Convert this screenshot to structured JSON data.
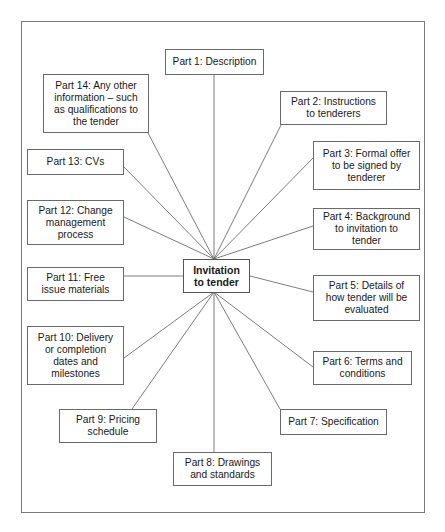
{
  "diagram": {
    "type": "hub-and-spoke",
    "center": {
      "id": "center",
      "label": "Invitation to tender",
      "lines": [
        "Invitation",
        "to tender"
      ]
    },
    "parts": [
      {
        "id": "part1",
        "label": "Part 1: Description",
        "lines": [
          "Part 1: Description"
        ]
      },
      {
        "id": "part2",
        "label": "Part 2: Instructions to tenderers",
        "lines": [
          "Part 2: Instructions",
          "to tenderers"
        ]
      },
      {
        "id": "part3",
        "label": "Part 3: Formal offer to be signed by tenderer",
        "lines": [
          "Part 3: Formal offer",
          "to be signed by",
          "tenderer"
        ]
      },
      {
        "id": "part4",
        "label": "Part 4: Background to invitation to tender",
        "lines": [
          "Part 4: Background",
          "to invitation to",
          "tender"
        ]
      },
      {
        "id": "part5",
        "label": "Part 5: Details of how tender will be evaluated",
        "lines": [
          "Part 5: Details of",
          "how tender will be",
          "evaluated"
        ]
      },
      {
        "id": "part6",
        "label": "Part 6: Terms and conditions",
        "lines": [
          "Part 6: Terms and",
          "conditions"
        ]
      },
      {
        "id": "part7",
        "label": "Part 7: Specification",
        "lines": [
          "Part 7: Specification"
        ]
      },
      {
        "id": "part8",
        "label": "Part 8: Drawings and standards",
        "lines": [
          "Part 8: Drawings",
          "and standards"
        ]
      },
      {
        "id": "part9",
        "label": "Part 9: Pricing schedule",
        "lines": [
          "Part 9: Pricing",
          "schedule"
        ]
      },
      {
        "id": "part10",
        "label": "Part 10: Delivery or completion dates and milestones",
        "lines": [
          "Part 10: Delivery",
          "or completion",
          "dates and",
          "milestones"
        ]
      },
      {
        "id": "part11",
        "label": "Part 11: Free issue materials",
        "lines": [
          "Part 11: Free",
          "issue materials"
        ]
      },
      {
        "id": "part12",
        "label": "Part 12: Change management process",
        "lines": [
          "Part 12: Change",
          "management",
          "process"
        ]
      },
      {
        "id": "part13",
        "label": "Part 13: CVs",
        "lines": [
          "Part 13: CVs"
        ]
      },
      {
        "id": "part14",
        "label": "Part 14: Any other information – such as qualifications to the tender",
        "lines": [
          "Part 14: Any other",
          "information – such",
          "as qualifications to",
          "the tender"
        ]
      }
    ],
    "edges": [
      [
        "center",
        "part1"
      ],
      [
        "center",
        "part2"
      ],
      [
        "center",
        "part3"
      ],
      [
        "center",
        "part4"
      ],
      [
        "center",
        "part5"
      ],
      [
        "center",
        "part6"
      ],
      [
        "center",
        "part7"
      ],
      [
        "center",
        "part8"
      ],
      [
        "center",
        "part9"
      ],
      [
        "center",
        "part10"
      ],
      [
        "center",
        "part11"
      ],
      [
        "center",
        "part12"
      ],
      [
        "center",
        "part13"
      ],
      [
        "center",
        "part14"
      ]
    ]
  }
}
